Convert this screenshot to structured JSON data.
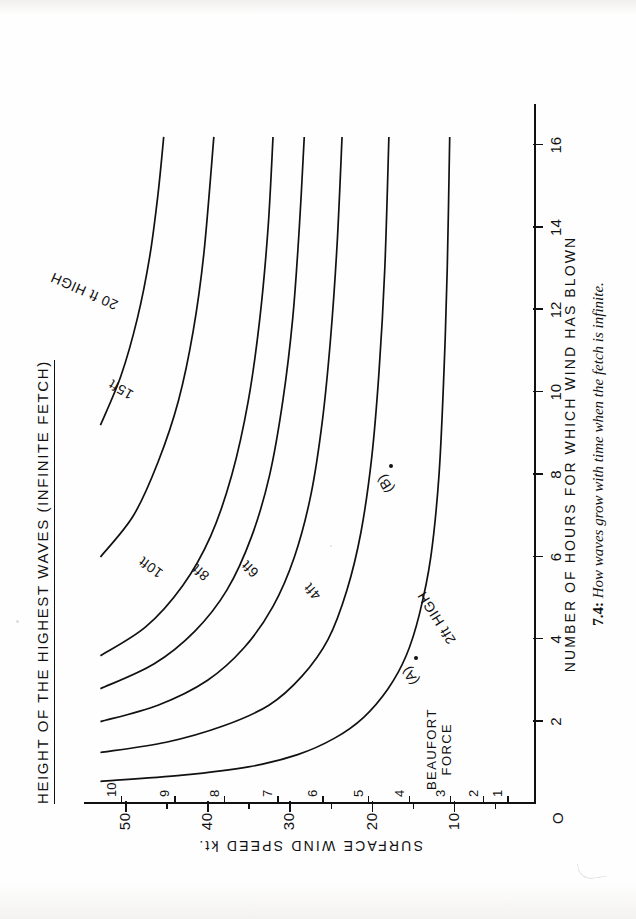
{
  "figure": {
    "title": "HEIGHT OF THE HIGHEST WAVES  (INFINITE FETCH)",
    "caption_number": "7.4:",
    "caption_text": " How waves grow with time when the fetch is infinite.",
    "origin_label": "O"
  },
  "axes": {
    "x": {
      "title": "NUMBER  OF  HOURS  FOR  WHICH  WIND  HAS  BLOWN",
      "ticks": [
        {
          "value": 2,
          "label": "2"
        },
        {
          "value": 4,
          "label": "4"
        },
        {
          "value": 6,
          "label": "6"
        },
        {
          "value": 8,
          "label": "8"
        },
        {
          "value": 10,
          "label": "10"
        },
        {
          "value": 12,
          "label": "12"
        },
        {
          "value": 14,
          "label": "14"
        },
        {
          "value": 16,
          "label": "16"
        }
      ],
      "range": [
        0,
        17
      ]
    },
    "y": {
      "title": "SURFACE  WIND  SPEED",
      "unit": "kt.",
      "ticks": [
        {
          "value": 10,
          "label": "10"
        },
        {
          "value": 20,
          "label": "20"
        },
        {
          "value": 30,
          "label": "30"
        },
        {
          "value": 40,
          "label": "40"
        },
        {
          "value": 50,
          "label": "50"
        }
      ],
      "minor_ticks": [
        5,
        15,
        25,
        35,
        45
      ],
      "range": [
        0,
        55
      ]
    },
    "beaufort": {
      "title_line1": "BEAUFORT",
      "title_line2": "FORCE",
      "ticks": [
        {
          "speed": 3.5,
          "label": "1"
        },
        {
          "speed": 6.5,
          "label": "2"
        },
        {
          "speed": 10.5,
          "label": "3"
        },
        {
          "speed": 15.5,
          "label": "4"
        },
        {
          "speed": 20.5,
          "label": "5"
        },
        {
          "speed": 26.0,
          "label": "6"
        },
        {
          "speed": 31.5,
          "label": "7"
        },
        {
          "speed": 38.0,
          "label": "8"
        },
        {
          "speed": 44.0,
          "label": "9"
        },
        {
          "speed": 50.5,
          "label": "10"
        }
      ]
    }
  },
  "chart_data": {
    "type": "line",
    "title": "HEIGHT OF THE HIGHEST WAVES  (INFINITE FETCH)",
    "xlabel": "NUMBER OF HOURS FOR WHICH WIND HAS BLOWN",
    "ylabel": "SURFACE WIND SPEED kt.",
    "xlim": [
      0,
      17
    ],
    "ylim": [
      0,
      55
    ],
    "grid": false,
    "legend": "inline curve labels",
    "note": "Each curve is a contour of constant significant wave height; x = hours the wind has blown, y = surface wind speed in knots.",
    "series": [
      {
        "name": "2ft HIGH",
        "label": "2ft HIGH",
        "height_ft": 2,
        "points": [
          {
            "x": 0.55,
            "y": 53.0
          },
          {
            "x": 0.7,
            "y": 43.0
          },
          {
            "x": 0.9,
            "y": 35.0
          },
          {
            "x": 1.2,
            "y": 29.0
          },
          {
            "x": 1.6,
            "y": 24.5
          },
          {
            "x": 2.1,
            "y": 21.0
          },
          {
            "x": 2.8,
            "y": 18.0
          },
          {
            "x": 3.6,
            "y": 15.8
          },
          {
            "x": 4.6,
            "y": 14.2
          },
          {
            "x": 6.0,
            "y": 12.8
          },
          {
            "x": 8.0,
            "y": 11.8
          },
          {
            "x": 10.5,
            "y": 11.2
          },
          {
            "x": 13.0,
            "y": 10.8
          },
          {
            "x": 16.2,
            "y": 10.5
          }
        ]
      },
      {
        "name": "4ft",
        "label": "4ft",
        "height_ft": 4,
        "points": [
          {
            "x": 1.25,
            "y": 53.0
          },
          {
            "x": 1.5,
            "y": 45.0
          },
          {
            "x": 1.9,
            "y": 38.0
          },
          {
            "x": 2.4,
            "y": 32.5
          },
          {
            "x": 3.1,
            "y": 28.5
          },
          {
            "x": 4.0,
            "y": 25.3
          },
          {
            "x": 5.2,
            "y": 23.0
          },
          {
            "x": 6.6,
            "y": 21.3
          },
          {
            "x": 8.4,
            "y": 20.0
          },
          {
            "x": 10.5,
            "y": 19.1
          },
          {
            "x": 13.0,
            "y": 18.4
          },
          {
            "x": 16.2,
            "y": 17.9
          }
        ]
      },
      {
        "name": "6ft",
        "label": "6ft",
        "height_ft": 6,
        "points": [
          {
            "x": 2.0,
            "y": 53.0
          },
          {
            "x": 2.4,
            "y": 46.0
          },
          {
            "x": 3.0,
            "y": 40.0
          },
          {
            "x": 3.8,
            "y": 35.5
          },
          {
            "x": 4.8,
            "y": 32.0
          },
          {
            "x": 6.0,
            "y": 29.4
          },
          {
            "x": 7.5,
            "y": 27.4
          },
          {
            "x": 9.3,
            "y": 26.0
          },
          {
            "x": 11.3,
            "y": 25.0
          },
          {
            "x": 13.6,
            "y": 24.2
          },
          {
            "x": 16.2,
            "y": 23.6
          }
        ]
      },
      {
        "name": "8ft",
        "label": "8ft",
        "height_ft": 8,
        "points": [
          {
            "x": 2.8,
            "y": 53.0
          },
          {
            "x": 3.4,
            "y": 46.5
          },
          {
            "x": 4.2,
            "y": 41.5
          },
          {
            "x": 5.2,
            "y": 37.6
          },
          {
            "x": 6.5,
            "y": 34.6
          },
          {
            "x": 8.0,
            "y": 32.4
          },
          {
            "x": 9.8,
            "y": 30.8
          },
          {
            "x": 11.8,
            "y": 29.6
          },
          {
            "x": 14.0,
            "y": 28.8
          },
          {
            "x": 16.2,
            "y": 28.2
          }
        ]
      },
      {
        "name": "10ft",
        "label": "10ft",
        "height_ft": 10,
        "points": [
          {
            "x": 3.6,
            "y": 53.0
          },
          {
            "x": 4.3,
            "y": 47.5
          },
          {
            "x": 5.3,
            "y": 43.0
          },
          {
            "x": 6.5,
            "y": 39.6
          },
          {
            "x": 8.0,
            "y": 37.0
          },
          {
            "x": 9.8,
            "y": 35.0
          },
          {
            "x": 11.8,
            "y": 33.6
          },
          {
            "x": 14.0,
            "y": 32.6
          },
          {
            "x": 16.2,
            "y": 32.0
          }
        ]
      },
      {
        "name": "15ft",
        "label": "15ft",
        "height_ft": 15,
        "points": [
          {
            "x": 6.0,
            "y": 53.0
          },
          {
            "x": 7.0,
            "y": 49.0
          },
          {
            "x": 8.3,
            "y": 46.0
          },
          {
            "x": 9.8,
            "y": 43.5
          },
          {
            "x": 11.5,
            "y": 41.7
          },
          {
            "x": 13.4,
            "y": 40.4
          },
          {
            "x": 16.2,
            "y": 39.2
          }
        ]
      },
      {
        "name": "20 ft HIGH",
        "label": "20 ft HIGH",
        "height_ft": 20,
        "points": [
          {
            "x": 9.2,
            "y": 53.0
          },
          {
            "x": 10.4,
            "y": 50.5
          },
          {
            "x": 11.8,
            "y": 48.5
          },
          {
            "x": 13.3,
            "y": 47.0
          },
          {
            "x": 14.8,
            "y": 46.0
          },
          {
            "x": 16.2,
            "y": 45.3
          }
        ]
      }
    ],
    "annotations": [
      {
        "name": "point-a",
        "label": "(A)",
        "x": 3.55,
        "y": 14.6,
        "marker": "dot"
      },
      {
        "name": "point-b",
        "label": "(B)",
        "x": 8.2,
        "y": 17.6,
        "marker": "dot"
      }
    ]
  }
}
